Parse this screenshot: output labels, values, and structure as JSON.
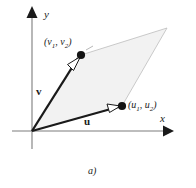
{
  "figure": {
    "caption": "a)",
    "fill_color": "#f2f2f2",
    "outline_color": "#b5b5b5",
    "axis_color": "#7a7a7a",
    "vector_color": "#1a1a1a"
  },
  "axes": {
    "x_label": "x",
    "y_label": "y",
    "origin": {
      "x": 32,
      "y": 131
    },
    "x_axis": {
      "x1": 12,
      "y1": 131,
      "x2": 165,
      "y2": 131,
      "arrow_tip_x": 173
    },
    "y_axis": {
      "x1": 32,
      "y1": 148,
      "x2": 32,
      "y2": 16,
      "arrow_tip_y": 7
    }
  },
  "vectors": [
    {
      "name": "v",
      "label": "v",
      "point_label_prefix": "(",
      "point_label_c1": "v",
      "point_label_sub1": "1",
      "point_label_mid": ", ",
      "point_label_c2": "v",
      "point_label_sub2": "2",
      "point_label_suffix": ")",
      "tip": {
        "x": 81,
        "y": 55
      }
    },
    {
      "name": "u",
      "label": "u",
      "point_label_prefix": "(",
      "point_label_c1": "u",
      "point_label_sub1": "1",
      "point_label_mid": ", ",
      "point_label_c2": "u",
      "point_label_sub2": "2",
      "point_label_suffix": ")",
      "tip": {
        "x": 122,
        "y": 106
      }
    }
  ],
  "parallelogram": {
    "vertices": [
      {
        "x": 32,
        "y": 131
      },
      {
        "x": 122,
        "y": 106
      },
      {
        "x": 167,
        "y": 28
      },
      {
        "x": 81,
        "y": 55
      }
    ]
  }
}
